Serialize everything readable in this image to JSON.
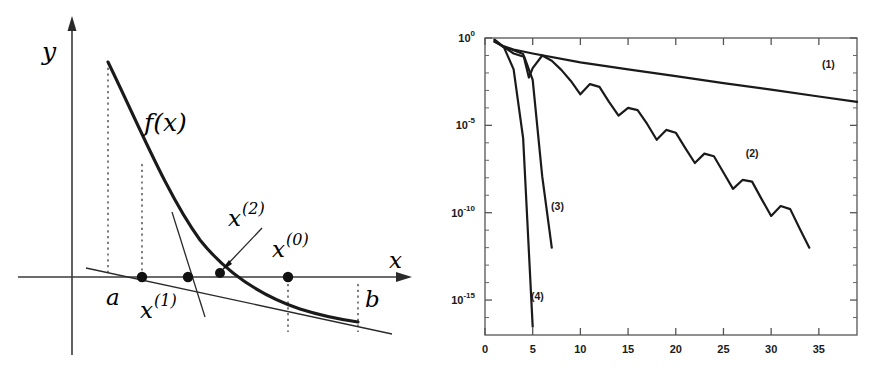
{
  "figure": {
    "background_color": "#ffffff",
    "ink_color": "#1a1a1a",
    "panels": [
      "newton-method-geometry",
      "convergence-history"
    ]
  },
  "left_panel": {
    "name": "newton-method-geometry",
    "axis_label_y": "y",
    "axis_label_x": "x",
    "function_label": "f(x)",
    "point_labels": {
      "x0": "x",
      "x0_sup": "(0)",
      "x1": "x",
      "x1_sup": "(1)",
      "x2": "x",
      "x2_sup": "(2)"
    },
    "interval_labels": {
      "left": "a",
      "right": "b"
    },
    "markers": [
      {
        "name": "a-point",
        "label": "a",
        "x": 142,
        "y": 277
      },
      {
        "name": "x1-point",
        "label": "x(1)",
        "x": 188,
        "y": 277
      },
      {
        "name": "x2-point",
        "label": "x(2)",
        "x": 222,
        "y": 272
      },
      {
        "name": "x0-point",
        "label": "x(0)",
        "x": 288,
        "y": 277
      }
    ],
    "dashed_verticals": [
      {
        "name": "f-of-a-dashed",
        "x": 108,
        "y_top": 60,
        "y_bottom": 277
      },
      {
        "name": "a-dashed",
        "x": 142,
        "y_top": 163,
        "y_bottom": 277
      },
      {
        "name": "x0-dashed",
        "x": 288,
        "y_top": 283,
        "y_bottom": 330
      },
      {
        "name": "b-dashed",
        "x": 358,
        "y_top": 283,
        "y_bottom": 330
      }
    ]
  },
  "chart_data": {
    "type": "line",
    "name": "convergence-history",
    "title": "",
    "xlabel": "",
    "ylabel": "",
    "yscale": "log",
    "xlim": [
      0,
      39
    ],
    "ylim": [
      1e-17,
      1
    ],
    "grid": false,
    "legend_position": "inline-annotations",
    "xticks": [
      0,
      5,
      10,
      15,
      20,
      25,
      30,
      35
    ],
    "xticklabels": [
      "0",
      "5",
      "10",
      "15",
      "20",
      "25",
      "30",
      "35"
    ],
    "yticks": [
      1,
      1e-05,
      1e-10,
      1e-15
    ],
    "yticklabels": [
      "10^0",
      "10^-5",
      "10^-10",
      "10^-15"
    ],
    "yticklabel_parts": [
      {
        "base": "10",
        "exp": "0"
      },
      {
        "base": "10",
        "exp": "-5"
      },
      {
        "base": "10",
        "exp": "-10"
      },
      {
        "base": "10",
        "exp": "-15"
      }
    ],
    "series": [
      {
        "name": "(1)",
        "label": "(1)",
        "label_x": 36.0,
        "label_y": 0.02,
        "x": [
          1,
          2,
          3,
          5,
          10,
          15,
          20,
          25,
          30,
          35,
          39
        ],
        "y": [
          0.6,
          0.33,
          0.22,
          0.13,
          0.04,
          0.016,
          0.0065,
          0.0026,
          0.0011,
          0.00045,
          0.00022
        ]
      },
      {
        "name": "(2)",
        "label": "(2)",
        "label_x": 28.0,
        "label_y": 1.5e-07,
        "x": [
          1,
          2,
          3,
          4,
          4.6,
          5,
          6,
          7,
          8,
          9,
          10,
          11,
          12,
          13,
          14,
          15,
          16,
          17,
          18,
          19,
          20,
          21,
          22,
          23,
          24,
          25,
          26,
          27,
          28,
          29,
          30,
          31,
          32,
          33,
          34
        ],
        "y": [
          0.62,
          0.3,
          0.2,
          0.12,
          0.0055,
          0.019,
          0.1,
          0.05,
          0.015,
          0.0035,
          0.0006,
          0.0023,
          0.0016,
          0.00022,
          3.6e-05,
          0.0001,
          7.5e-05,
          1.2e-05,
          1.5e-06,
          5.5e-06,
          3.8e-06,
          5e-07,
          7e-08,
          2.4e-07,
          1.7e-07,
          2e-08,
          2.3e-09,
          7.5e-09,
          6e-09,
          6e-10,
          6.5e-11,
          2.4e-10,
          1.6e-10,
          1.2e-11,
          1e-12
        ]
      },
      {
        "name": "(3)",
        "label": "(3)",
        "label_x": 7.6,
        "label_y": 1.5e-10,
        "x": [
          1,
          2,
          3,
          3.9,
          4.1,
          5,
          6,
          7
        ],
        "y": [
          0.8,
          0.3,
          0.13,
          0.09,
          0.09,
          0.004,
          1.2e-08,
          1e-12
        ]
      },
      {
        "name": "(4)",
        "label": "(4)",
        "label_x": 5.5,
        "label_y": 1e-15,
        "x": [
          1,
          2,
          3,
          4,
          5
        ],
        "y": [
          0.75,
          0.28,
          0.016,
          1.8e-06,
          3e-17
        ]
      }
    ]
  }
}
